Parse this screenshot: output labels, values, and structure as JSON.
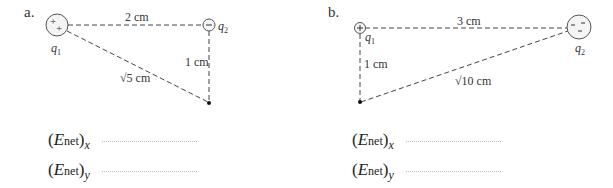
{
  "problems": [
    {
      "label": "a.",
      "q1": {
        "name": "q",
        "sub": "1",
        "sign": "positive",
        "symbols": "+ +"
      },
      "q2": {
        "name": "q",
        "sub": "2",
        "sign": "negative",
        "symbols": "−"
      },
      "distances": {
        "horizontal": "2 cm",
        "vertical": "1 cm",
        "diagonal": "√5 cm"
      },
      "answers": [
        {
          "symbol": "E",
          "sub": "net",
          "component": "x"
        },
        {
          "symbol": "E",
          "sub": "net",
          "component": "y"
        }
      ]
    },
    {
      "label": "b.",
      "q1": {
        "name": "q",
        "sub": "1",
        "sign": "positive",
        "symbols": "+"
      },
      "q2": {
        "name": "q",
        "sub": "2",
        "sign": "negative",
        "symbols": "− − −"
      },
      "distances": {
        "horizontal": "3 cm",
        "vertical": "1 cm",
        "diagonal": "√10 cm"
      },
      "answers": [
        {
          "symbol": "E",
          "sub": "net",
          "component": "x"
        },
        {
          "symbol": "E",
          "sub": "net",
          "component": "y"
        }
      ]
    }
  ],
  "colors": {
    "line": "#444444",
    "text": "#333333",
    "circle": "#555555"
  }
}
